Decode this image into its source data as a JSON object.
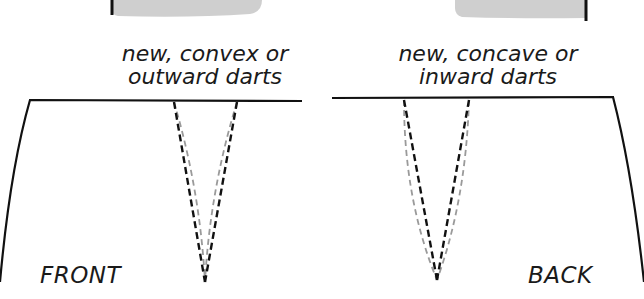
{
  "captions": {
    "front": {
      "line1": "new, convex or",
      "line2": "outward darts"
    },
    "back": {
      "line1": "new, concave or",
      "line2": "inward darts"
    }
  },
  "labels": {
    "front": "FRONT",
    "back": "BACK"
  },
  "colors": {
    "outline": "#111111",
    "new_dart": "#111111",
    "original_dart": "#9a9a9a",
    "gray_fill": "#cfcfcf"
  },
  "legend": {
    "black_dashed": "new darts",
    "gray_dashed": "original straight darts"
  }
}
